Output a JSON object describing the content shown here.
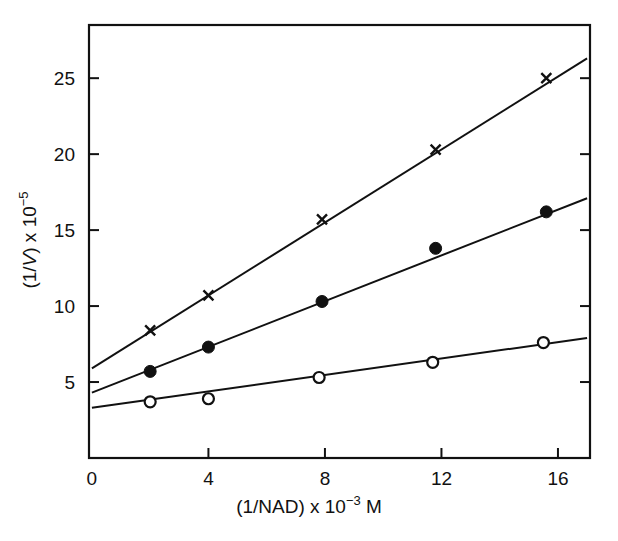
{
  "figure": {
    "background_color": "#ffffff",
    "ink_color": "#111111"
  },
  "chart_data": {
    "type": "line",
    "title": "",
    "subtitle": "",
    "xlabel": "(1/NAD) x 10−3 M",
    "ylabel": "(1/V) x 10−5",
    "xlabel_parts": {
      "prefix": "(1/NAD) x 10",
      "exponent": "−3",
      "suffix": " M"
    },
    "ylabel_parts": {
      "prefix": "(1/",
      "italic": "V",
      "mid": ") x 10",
      "exponent": "−5"
    },
    "xlim": [
      -0.1,
      17.1
    ],
    "ylim": [
      0.0,
      28.5
    ],
    "xticks": [
      0,
      4,
      8,
      12,
      16
    ],
    "xtick_labels": [
      "0",
      "4",
      "8",
      "12",
      "16"
    ],
    "yticks": [
      5,
      10,
      15,
      20,
      25
    ],
    "ytick_labels": [
      "5",
      "10",
      "15",
      "20",
      "25"
    ],
    "grid": false,
    "legend": "none",
    "tick_direction": "in",
    "frame": "box",
    "series": [
      {
        "name": "cross-series",
        "marker": "x",
        "marker_label": "×",
        "color": "#111111",
        "x": [
          2.0,
          4.0,
          7.9,
          11.8,
          15.6
        ],
        "values": [
          8.4,
          10.7,
          15.7,
          20.3,
          25.0
        ],
        "y_intercept": 5.9,
        "fit_x": [
          0.0,
          17.0
        ],
        "fit_y": [
          5.9,
          26.3
        ]
      },
      {
        "name": "filled-circle-series",
        "marker": "filled-circle",
        "marker_label": "●",
        "color": "#111111",
        "x": [
          2.0,
          4.0,
          7.9,
          11.8,
          15.6
        ],
        "values": [
          5.7,
          7.3,
          10.3,
          13.8,
          16.2
        ],
        "y_intercept": 4.3,
        "fit_x": [
          0.0,
          17.0
        ],
        "fit_y": [
          4.3,
          17.1
        ]
      },
      {
        "name": "open-circle-series",
        "marker": "open-circle",
        "marker_label": "○",
        "color": "#111111",
        "x": [
          2.0,
          4.0,
          7.8,
          11.7,
          15.5
        ],
        "values": [
          3.7,
          3.9,
          5.3,
          6.3,
          7.6
        ],
        "y_intercept": 3.3,
        "fit_x": [
          0.0,
          17.0
        ],
        "fit_y": [
          3.3,
          7.9
        ]
      }
    ]
  }
}
